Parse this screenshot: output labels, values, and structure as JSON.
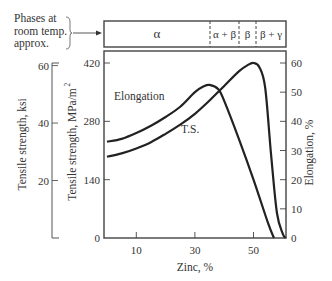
{
  "phase_panel": {
    "label_lines": [
      "Phases at",
      "room temp.",
      "approx."
    ],
    "phases": [
      {
        "label": "α",
        "from": 0,
        "to": 36
      },
      {
        "label": "α + β",
        "from": 36,
        "to": 46
      },
      {
        "label": "β",
        "from": 46,
        "to": 52
      },
      {
        "label": "β + γ",
        "from": 52,
        "to": 62
      }
    ]
  },
  "chart_data": {
    "type": "line",
    "title": "",
    "xlabel": "Zinc, %",
    "xticks": [
      10,
      30,
      50
    ],
    "xlim": [
      0,
      62
    ],
    "y_axes": [
      {
        "name": "Tensile strength, ksi",
        "side": "left-outer",
        "ticks": [
          20,
          40,
          60
        ],
        "lim": [
          0,
          61
        ]
      },
      {
        "name": "Tensile strength, MPa/m²",
        "side": "left",
        "ticks": [
          0,
          140,
          280,
          420
        ],
        "lim": [
          0,
          420
        ]
      },
      {
        "name": "Elongation, %",
        "side": "right",
        "ticks": [
          0,
          10,
          20,
          30,
          40,
          50,
          60
        ],
        "lim": [
          0,
          60
        ]
      }
    ],
    "series": [
      {
        "name": "Elongation",
        "axis": "Elongation, %",
        "x": [
          0,
          5,
          10,
          15,
          20,
          25,
          30,
          33,
          35,
          38,
          40,
          45,
          50,
          55,
          57
        ],
        "y": [
          33,
          34,
          36,
          38.5,
          41.5,
          45,
          50,
          52,
          52.5,
          51,
          47,
          34,
          20,
          5,
          0
        ]
      },
      {
        "name": "T.S.",
        "axis": "Tensile strength, MPa/m²",
        "x": [
          0,
          5,
          10,
          15,
          20,
          25,
          30,
          35,
          40,
          45,
          48,
          50,
          52,
          54,
          56,
          58,
          60,
          61
        ],
        "y": [
          195,
          203,
          215,
          230,
          250,
          272,
          298,
          330,
          365,
          400,
          415,
          420,
          410,
          360,
          200,
          60,
          10,
          0
        ]
      }
    ],
    "annotations": [
      "Elongation",
      "T.S."
    ]
  }
}
